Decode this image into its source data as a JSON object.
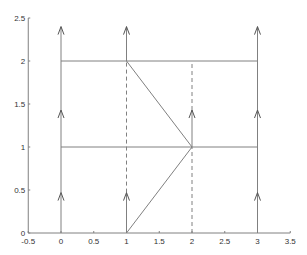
{
  "figure": {
    "width": 307,
    "height": 255,
    "line_color": "#808080",
    "axis_color": "#808080",
    "label_color": "#333333"
  },
  "axes": {
    "xlim": [
      -0.5,
      3.5
    ],
    "ylim": [
      0,
      2.5
    ],
    "x_ticks": [
      {
        "value": -0.5,
        "label": "-0.5"
      },
      {
        "value": 0,
        "label": "0"
      },
      {
        "value": 0.5,
        "label": "0.5"
      },
      {
        "value": 1,
        "label": "1"
      },
      {
        "value": 1.5,
        "label": "1.5"
      },
      {
        "value": 2,
        "label": "2"
      },
      {
        "value": 2.5,
        "label": "2.5"
      },
      {
        "value": 3,
        "label": "3"
      },
      {
        "value": 3.5,
        "label": "3.5"
      }
    ],
    "y_ticks": [
      {
        "value": 0,
        "label": "0"
      },
      {
        "value": 0.5,
        "label": "0.5"
      },
      {
        "value": 1,
        "label": "1"
      },
      {
        "value": 1.5,
        "label": "1.5"
      },
      {
        "value": 2,
        "label": "2"
      },
      {
        "value": 2.5,
        "label": "2.5"
      }
    ]
  },
  "diagram": {
    "solid_segments": [
      {
        "from": [
          0,
          0
        ],
        "to": [
          0,
          2.4
        ]
      },
      {
        "from": [
          3,
          0
        ],
        "to": [
          3,
          2.4
        ]
      },
      {
        "from": [
          0,
          1
        ],
        "to": [
          3,
          1
        ]
      },
      {
        "from": [
          0,
          2
        ],
        "to": [
          3,
          2
        ]
      },
      {
        "from": [
          1,
          0
        ],
        "to": [
          1,
          0.47
        ]
      },
      {
        "from": [
          1,
          2
        ],
        "to": [
          1,
          2.4
        ]
      },
      {
        "from": [
          2,
          1
        ],
        "to": [
          2,
          1.43
        ]
      },
      {
        "from": [
          1,
          0
        ],
        "to": [
          2,
          1
        ]
      },
      {
        "from": [
          1,
          2
        ],
        "to": [
          2,
          1
        ]
      }
    ],
    "dashed_segments": [
      {
        "from": [
          1,
          0.47
        ],
        "to": [
          1,
          2
        ]
      },
      {
        "from": [
          2,
          0
        ],
        "to": [
          2,
          1
        ]
      },
      {
        "from": [
          2,
          1.43
        ],
        "to": [
          2,
          2
        ]
      }
    ],
    "arrowheads": [
      {
        "at": [
          0,
          0.47
        ]
      },
      {
        "at": [
          0,
          1.43
        ]
      },
      {
        "at": [
          0,
          2.4
        ]
      },
      {
        "at": [
          1,
          0.47
        ]
      },
      {
        "at": [
          1,
          2.4
        ]
      },
      {
        "at": [
          2,
          1.43
        ]
      },
      {
        "at": [
          3,
          0.47
        ]
      },
      {
        "at": [
          3,
          1.43
        ]
      },
      {
        "at": [
          3,
          2.4
        ]
      }
    ]
  }
}
